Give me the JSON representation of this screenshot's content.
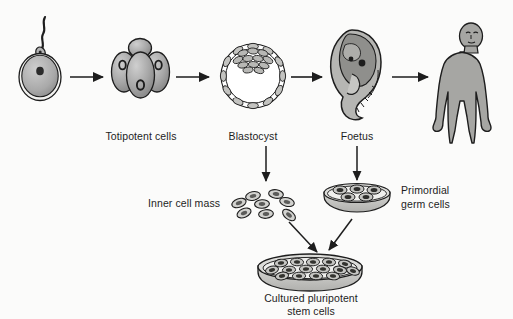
{
  "diagram": {
    "background_color": "#fbfbfa",
    "ink_color": "#1d1d1d",
    "cell_fill": "#9d9d9d",
    "dish_fill": "#c9c9c6"
  },
  "labels": {
    "totipotent_cells": "Totipotent cells",
    "blastocyst": "Blastocyst",
    "foetus": "Foetus",
    "inner_cell_mass": "Inner cell mass",
    "primordial_germ_cells_line1": "Primordial",
    "primordial_germ_cells_line2": "germ cells",
    "cultured_line1": "Cultured pluripotent",
    "cultured_line2": "stem cells"
  },
  "stages": [
    {
      "id": "fertilised-ovum",
      "label": "",
      "icon": "ovum-with-sperm-icon"
    },
    {
      "id": "totipotent-cells",
      "label": "Totipotent cells",
      "icon": "morula-icon"
    },
    {
      "id": "blastocyst",
      "label": "Blastocyst",
      "icon": "blastocyst-icon"
    },
    {
      "id": "foetus",
      "label": "Foetus",
      "icon": "foetus-icon"
    },
    {
      "id": "adult-human",
      "label": "",
      "icon": "adult-human-icon"
    }
  ],
  "derived": [
    {
      "id": "inner-cell-mass",
      "label": "Inner cell mass",
      "icon": "scattered-cells-icon",
      "count": 7
    },
    {
      "id": "primordial-germ-cells",
      "label": "Primordial germ cells",
      "icon": "petri-dish-small-icon",
      "count": 6
    },
    {
      "id": "cultured-pluripotent-stem-cells",
      "label": "Cultured pluripotent stem cells",
      "icon": "petri-dish-large-icon",
      "count": 17
    }
  ],
  "arrows": [
    {
      "id": "ovum-to-totipotent",
      "direction": "right"
    },
    {
      "id": "totipotent-to-blastocyst",
      "direction": "right"
    },
    {
      "id": "blastocyst-to-foetus",
      "direction": "right"
    },
    {
      "id": "foetus-to-adult",
      "direction": "right"
    },
    {
      "id": "blastocyst-to-inner-cell-mass",
      "direction": "down"
    },
    {
      "id": "foetus-to-germ-cells",
      "direction": "down"
    },
    {
      "id": "inner-cell-mass-to-culture",
      "direction": "down-right"
    },
    {
      "id": "germ-cells-to-culture",
      "direction": "down-left"
    }
  ]
}
